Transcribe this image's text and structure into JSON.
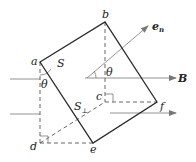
{
  "diagram": {
    "points": {
      "a": "a",
      "b": "b",
      "c": "c",
      "d": "d",
      "e": "e",
      "f": "f"
    },
    "labels": {
      "area": "S",
      "projected_area": "S",
      "projected_area_sub": "⊥",
      "normal_vector": "e",
      "normal_vector_sub": "n",
      "field": "B",
      "angle_left": "θ",
      "angle_right": "θ"
    },
    "colors": {
      "line": "#2a2a2a",
      "dashed": "#555555",
      "arrow": "#777777"
    }
  }
}
